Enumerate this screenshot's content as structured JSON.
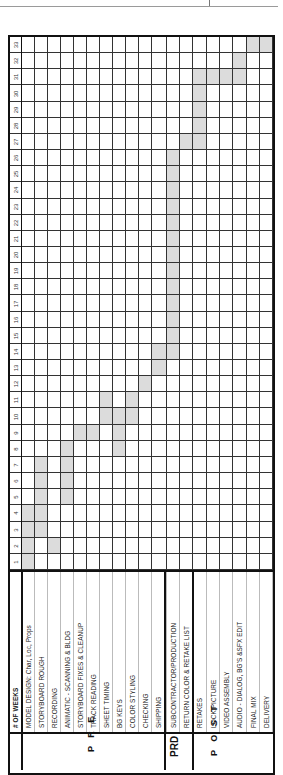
{
  "header": {
    "weeks_label": "# OF WEEKS"
  },
  "phases": [
    {
      "id": "pre",
      "label": "P R E"
    },
    {
      "id": "prd",
      "label": "PRD"
    },
    {
      "id": "post",
      "label": "P O S T"
    }
  ],
  "weeks": [
    1,
    2,
    3,
    4,
    5,
    6,
    7,
    8,
    9,
    10,
    11,
    12,
    13,
    14,
    15,
    16,
    17,
    18,
    19,
    20,
    21,
    22,
    23,
    24,
    25,
    26,
    27,
    28,
    29,
    30,
    31,
    32,
    33
  ],
  "tasks": [
    {
      "label": "MODEL DESIGN: Char, Loc, Props",
      "phase": "pre",
      "weeks": [
        1,
        2,
        3,
        4
      ]
    },
    {
      "label": "STORYBOARD ROUGH",
      "phase": "pre",
      "weeks": [
        3,
        4,
        5,
        6,
        7
      ]
    },
    {
      "label": "RECORDING",
      "phase": "pre",
      "weeks": [
        2
      ]
    },
    {
      "label": "ANIMATIC - SCANNING & BLDG",
      "phase": "pre",
      "weeks": [
        5,
        6,
        7,
        8
      ]
    },
    {
      "label": "STORYBOARD FIXES & CLEANUP",
      "phase": "pre",
      "weeks": [
        9
      ]
    },
    {
      "label": "TRACK READING",
      "phase": "pre",
      "weeks": [
        9
      ]
    },
    {
      "label": "SHEET TIMING",
      "phase": "pre",
      "weeks": [
        10,
        11
      ]
    },
    {
      "label": "BG KEYS",
      "phase": "pre",
      "weeks": [
        8,
        9,
        10
      ]
    },
    {
      "label": "COLOR STYLING",
      "phase": "pre",
      "weeks": [
        10,
        11
      ]
    },
    {
      "label": "CHECKING",
      "phase": "pre",
      "weeks": [
        12
      ]
    },
    {
      "label": "SHIPPING",
      "phase": "pre",
      "weeks": [
        13,
        14
      ]
    },
    {
      "label": "SUBCONTRACTOR/PRODUCTION",
      "phase": "prd",
      "weeks": [
        14,
        15,
        16,
        17,
        18,
        19,
        20,
        21,
        22,
        23,
        24,
        25,
        26
      ]
    },
    {
      "label": "RETURN COLOR & RETAKE LIST",
      "phase": "prd",
      "weeks": [
        27
      ]
    },
    {
      "label": "RETAKES",
      "phase": "post",
      "weeks": [
        27,
        28,
        29,
        30,
        31
      ]
    },
    {
      "label": "LOCK PICTURE",
      "phase": "post",
      "weeks": [
        31
      ]
    },
    {
      "label": "VIDEO ASSEMBLY",
      "phase": "post",
      "weeks": [
        31
      ]
    },
    {
      "label": "AUDIO - DIALOG, BG'S &SFX EDIT",
      "phase": "post",
      "weeks": [
        31,
        32
      ]
    },
    {
      "label": "FINAL MIX",
      "phase": "post",
      "weeks": [
        33
      ]
    },
    {
      "label": "DELIVERY",
      "phase": "post",
      "weeks": [
        33
      ]
    }
  ],
  "colors": {
    "shade": "#dcdcdc",
    "grid": "#333333",
    "border": "#111111"
  }
}
